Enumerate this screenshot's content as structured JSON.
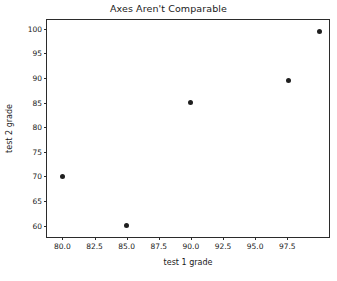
{
  "chart_data": {
    "type": "scatter",
    "title": "Axes Aren't Comparable",
    "xlabel": "test 1 grade",
    "ylabel": "test 2 grade",
    "xlim": [
      78.8,
      100.9
    ],
    "ylim": [
      57.3,
      101.8
    ],
    "xticks": [
      80.0,
      82.5,
      85.0,
      87.5,
      90.0,
      92.5,
      95.0,
      97.5
    ],
    "xtick_labels": [
      "80.0",
      "82.5",
      "85.0",
      "87.5",
      "90.0",
      "92.5",
      "95.0",
      "97.5"
    ],
    "yticks": [
      60,
      65,
      70,
      75,
      80,
      85,
      90,
      95,
      100
    ],
    "ytick_labels": [
      "60",
      "65",
      "70",
      "75",
      "80",
      "85",
      "90",
      "95",
      "100"
    ],
    "grid": false,
    "legend": null,
    "marker_color": "#1f1f1f",
    "points": [
      {
        "x": 80.0,
        "y": 70.0
      },
      {
        "x": 85.0,
        "y": 60.0
      },
      {
        "x": 90.0,
        "y": 85.0
      },
      {
        "x": 97.6,
        "y": 89.5
      },
      {
        "x": 100.0,
        "y": 99.5
      }
    ],
    "series": [
      {
        "name": "grades",
        "x": [
          80.0,
          85.0,
          90.0,
          97.6,
          100.0
        ],
        "values": [
          70.0,
          60.0,
          85.0,
          89.5,
          99.5
        ]
      }
    ]
  }
}
